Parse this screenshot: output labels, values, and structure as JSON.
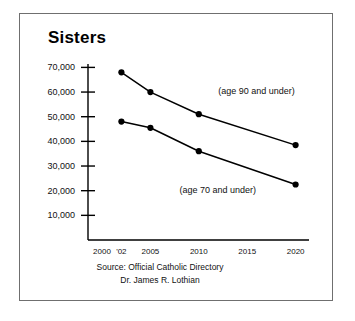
{
  "figure": {
    "title": "Sisters",
    "background_color": "#ffffff",
    "frame_color": "#6f6f6f",
    "line_color": "#000000"
  },
  "source": {
    "line1": "Source: Official Catholic Directory",
    "line2": "Dr. James R. Lothian"
  },
  "chart_data": {
    "type": "line",
    "title": "Sisters",
    "xlabel": "",
    "ylabel": "",
    "grid": false,
    "legend_position": "inline-annotations",
    "xlim": [
      2000,
      2022
    ],
    "ylim": [
      0,
      73000
    ],
    "x_tick_labels": [
      "2000",
      "'02",
      "2005",
      "2010",
      "2015",
      "2020"
    ],
    "x_tick_values": [
      2000,
      2002,
      2005,
      2010,
      2015,
      2020
    ],
    "y_tick_labels": [
      "10,000",
      "20,000",
      "30,000",
      "40,000",
      "50,000",
      "60,000",
      "70,000"
    ],
    "y_tick_values": [
      10000,
      20000,
      30000,
      40000,
      50000,
      60000,
      70000
    ],
    "x": [
      2002,
      2005,
      2010,
      2020
    ],
    "series": [
      {
        "name": "(age 90 and under)",
        "values": [
          68000,
          60000,
          51000,
          38500
        ],
        "annotation_x": 2012,
        "annotation_y": 60000
      },
      {
        "name": "(age 70 and under)",
        "values": [
          48000,
          45500,
          36000,
          22500
        ],
        "annotation_x": 2008,
        "annotation_y": 20000
      }
    ]
  }
}
